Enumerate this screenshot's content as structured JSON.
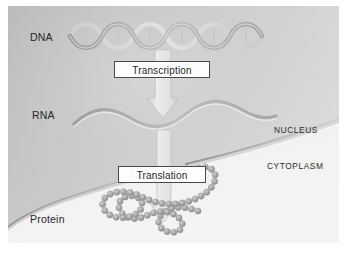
{
  "figure": {
    "background_color": "#e9e9e9",
    "page_color": "#ffffff"
  },
  "labels": {
    "dna": "DNA",
    "rna": "RNA",
    "protein": "Protein",
    "nucleus": "NUCLEUS",
    "cytoplasm": "CYTOPLASM"
  },
  "processes": {
    "transcription": "Transcription",
    "translation": "Translation"
  },
  "molecules": {
    "dna": {
      "name": "dna-double-helix",
      "description": "double helix ribbon",
      "strand_count": 2,
      "turns": 5,
      "color": "#a9a9a9"
    },
    "rna": {
      "name": "rna-single-strand",
      "description": "single wavy ribbon",
      "strand_count": 1,
      "waves": 3,
      "color": "#b4b4b4"
    },
    "protein": {
      "name": "protein-amino-acid-chain",
      "description": "chain of amino acid spheres folded into loops",
      "bead_count": 62,
      "color": "#9e9e9e"
    }
  },
  "structures": {
    "nuclear_membrane": {
      "name": "nuclear-membrane",
      "description": "curved double-line nuclear envelope with a nuclear pore",
      "color": "#8e8e8e"
    },
    "nuclear_pore": {
      "name": "nuclear-pore",
      "description": "gap in the nuclear envelope through which the arrow passes"
    }
  },
  "arrows": {
    "transcription_arrow": {
      "name": "transcription-arrow",
      "direction": "down",
      "from": "DNA",
      "to": "RNA",
      "color": "#dcdcdc"
    },
    "translation_arrow": {
      "name": "translation-arrow",
      "direction": "down",
      "from": "RNA",
      "to": "Protein",
      "color": "#dcdcdc"
    }
  }
}
